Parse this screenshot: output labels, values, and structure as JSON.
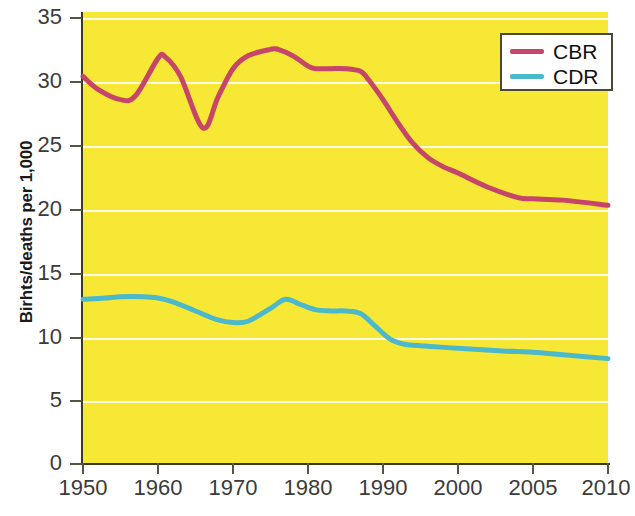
{
  "chart_data": {
    "type": "line",
    "title": "",
    "xlabel": "",
    "ylabel": "Birhts/deaths per 1,000",
    "ylim": [
      0,
      35
    ],
    "ytick_labels": [
      "35",
      "30",
      "25",
      "20",
      "15",
      "10",
      "5",
      "0"
    ],
    "ytick_values": [
      35,
      30,
      25,
      20,
      15,
      10,
      5,
      0
    ],
    "xtick_labels": [
      "1950",
      "1960",
      "1970",
      "1980",
      "1990",
      "2000",
      "2005",
      "2010"
    ],
    "xtick_values": [
      1950,
      1960,
      1970,
      1980,
      1990,
      2000,
      2005,
      2010
    ],
    "x_axis_scale": "categorical-uneven",
    "grid": "horizontal",
    "legend_position": "top-right",
    "plot_background": "#F7E835",
    "series": [
      {
        "name": "CBR",
        "color": "#C6456A",
        "x": [
          1950,
          1952,
          1955,
          1957,
          1960,
          1961,
          1963,
          1966,
          1968,
          1970,
          1972,
          1975,
          1976,
          1978,
          1980,
          1981,
          1983,
          1985,
          1987,
          1988,
          1990,
          1992,
          1994,
          1996,
          1998,
          2000,
          2002,
          2004,
          2005,
          2007,
          2010
        ],
        "values": [
          30.0,
          29.0,
          28.2,
          28.5,
          31.4,
          31.5,
          30.0,
          26.0,
          28.4,
          30.6,
          31.6,
          32.1,
          32.1,
          31.6,
          30.8,
          30.6,
          30.6,
          30.6,
          30.4,
          29.8,
          28.2,
          26.4,
          24.8,
          23.7,
          23.0,
          22.5,
          21.4,
          20.6,
          20.5,
          20.4,
          20.0
        ]
      },
      {
        "name": "CDR",
        "color": "#4BB8CC",
        "x": [
          1950,
          1953,
          1955,
          1958,
          1960,
          1962,
          1965,
          1968,
          1970,
          1972,
          1975,
          1977,
          1979,
          1981,
          1983,
          1985,
          1987,
          1989,
          1991,
          1993,
          1995,
          2000,
          2003,
          2005,
          2007,
          2010
        ],
        "values": [
          12.7,
          12.8,
          12.9,
          12.9,
          12.8,
          12.5,
          11.8,
          11.1,
          10.9,
          11.0,
          12.0,
          12.7,
          12.3,
          11.9,
          11.8,
          11.8,
          11.6,
          10.6,
          9.6,
          9.2,
          9.1,
          8.9,
          8.7,
          8.6,
          8.4,
          8.1
        ]
      }
    ]
  },
  "legend": {
    "entries": [
      {
        "label": "CBR",
        "color": "#C6456A"
      },
      {
        "label": "CDR",
        "color": "#4BB8CC"
      }
    ]
  }
}
